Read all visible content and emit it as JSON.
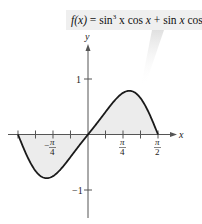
{
  "chart_data": {
    "type": "line",
    "function": "sin(x)^3*cos(x) + sin(x)*cos(x)",
    "xlabel": "x",
    "ylabel": "y",
    "xlim": [
      -1.5708,
      1.5708
    ],
    "ylim": [
      -1,
      1
    ],
    "x_ticks": [
      {
        "value": -0.7854,
        "label_num": "π",
        "label_den": "4",
        "negative": true
      },
      {
        "value": 0.7854,
        "label_num": "π",
        "label_den": "4",
        "negative": false
      },
      {
        "value": 1.5708,
        "label_num": "π",
        "label_den": "2",
        "negative": false
      }
    ],
    "x_minor_tick_step": 0.3927,
    "y_ticks": [
      {
        "value": 1,
        "label": "1"
      },
      {
        "value": -1,
        "label": "−1"
      }
    ],
    "shaded_region": "between curve and x-axis on [-π/2, π/2]",
    "x": [
      -1.5708,
      -1.1781,
      -1.0472,
      -0.7854,
      -0.3927,
      0,
      0.3927,
      0.7854,
      1.0472,
      1.1781,
      1.5708
    ],
    "values": [
      0,
      -0.7,
      -0.758,
      -0.75,
      -0.429,
      0,
      0.429,
      0.75,
      0.758,
      0.7,
      0
    ],
    "grid": false,
    "legend": "none",
    "colors": {
      "curve": "#1a1a1a",
      "fill": "#ececec",
      "axis": "#555555",
      "banner": "#efefef"
    }
  },
  "banner": {
    "lhs": "f(x)",
    "eq": " = sin",
    "sup": "3",
    "rest1": " x  cos ",
    "x1": "x",
    "rest2": " + sin ",
    "x2": "x",
    "rest3": " cos ",
    "x3": "x"
  },
  "axes": {
    "x_label": "x",
    "y_label": "y",
    "y_tick_1": "1",
    "y_tick_m1": "−1",
    "pi": "π",
    "four": "4",
    "two": "2",
    "minus": "−"
  }
}
